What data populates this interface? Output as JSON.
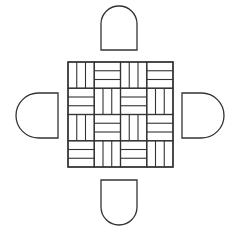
{
  "diagram": {
    "title": "",
    "table": {
      "shape": "square",
      "pattern": "basketweave parquet",
      "grid": 4,
      "slats_per_cell": 3,
      "x": 68,
      "y": 62,
      "size": 105
    },
    "chairs": [
      {
        "position": "top",
        "x": 101,
        "y": 6,
        "w": 36,
        "h": 44
      },
      {
        "position": "bottom",
        "x": 101,
        "y": 180,
        "w": 36,
        "h": 45
      },
      {
        "position": "left",
        "x": 16,
        "y": 93,
        "w": 42,
        "h": 45
      },
      {
        "position": "right",
        "x": 182,
        "y": 93,
        "w": 42,
        "h": 45
      }
    ],
    "colors": {
      "stroke": "#333333",
      "background": "#ffffff"
    }
  }
}
